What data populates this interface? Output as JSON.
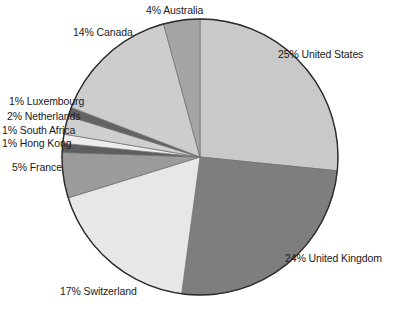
{
  "chart_data": {
    "type": "pie",
    "title": "",
    "subtitle": "",
    "xlabel": "",
    "ylabel": "",
    "legend_position": "none",
    "grid": false,
    "units": "percent",
    "start_angle_deg": 0,
    "direction": "clockwise",
    "categories": [
      "United States",
      "United Kingdom",
      "Switzerland",
      "France",
      "Hong Kong",
      "South Africa",
      "Netherlands",
      "Luxembourg",
      "Canada",
      "Australia"
    ],
    "values": [
      25,
      24,
      17,
      5,
      1,
      1,
      2,
      1,
      14,
      4
    ],
    "slices": [
      {
        "label": "25% United States",
        "name": "United States",
        "value": 25,
        "color": "#c9c9c9",
        "label_side": "right",
        "label_x": 278,
        "label_y": 48
      },
      {
        "label": "24% United Kingdom",
        "name": "United Kingdom",
        "value": 24,
        "color": "#7e7e7e",
        "label_side": "right",
        "label_x": 285,
        "label_y": 252
      },
      {
        "label": "17% Switzerland",
        "name": "Switzerland",
        "value": 17,
        "color": "#e7e7e7",
        "label_side": "left",
        "label_x": 60,
        "label_y": 285
      },
      {
        "label": "5% France",
        "name": "France",
        "value": 5,
        "color": "#9b9b9b",
        "label_side": "left",
        "label_x": 12,
        "label_y": 161
      },
      {
        "label": "1% Hong Kong",
        "name": "Hong Kong",
        "value": 1,
        "color": "#5e5e5e",
        "label_side": "left",
        "label_x": 2,
        "label_y": 137
      },
      {
        "label": "1% South Africa",
        "name": "South Africa",
        "value": 1,
        "color": "#ededed",
        "label_side": "left",
        "label_x": 2,
        "label_y": 124
      },
      {
        "label": "2% Netherlands",
        "name": "Netherlands",
        "value": 2,
        "color": "#cfcfcf",
        "label_side": "left",
        "label_x": 7,
        "label_y": 110
      },
      {
        "label": "1% Luxembourg",
        "name": "Luxembourg",
        "value": 1,
        "color": "#636363",
        "label_side": "left",
        "label_x": 9,
        "label_y": 95
      },
      {
        "label": "14% Canada",
        "name": "Canada",
        "value": 14,
        "color": "#cdcdcd",
        "label_side": "left",
        "label_x": 73,
        "label_y": 26
      },
      {
        "label": "4% Australia",
        "name": "Australia",
        "value": 4,
        "color": "#a5a5a5",
        "label_side": "center",
        "label_x": 146,
        "label_y": 4
      }
    ],
    "geometry": {
      "center_x": 200,
      "center_y": 157,
      "radius": 138,
      "outline_color": "#2b2b2b",
      "outline_width": 1.4
    }
  }
}
